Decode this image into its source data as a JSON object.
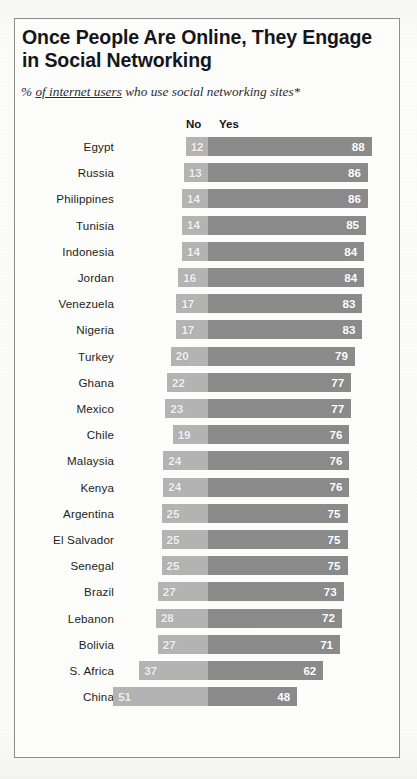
{
  "header": {
    "title": "Once People Are Online, They Engage in Social Networking",
    "subtitle_prefix": "% ",
    "subtitle_underlined": "of internet users",
    "subtitle_suffix": " who use social networking sites*"
  },
  "colors": {
    "no_bar": "#b4b4b4",
    "yes_bar": "#8b8b8b",
    "frame": "#8d8d8d",
    "text": "#15161a",
    "value_text": "#ffffff"
  },
  "chart_data": {
    "type": "bar",
    "title": "Once People Are Online, They Engage in Social Networking",
    "subtitle": "% of internet users who use social networking sites*",
    "orientation": "horizontal",
    "stacked": true,
    "diverging": true,
    "xlabel": "",
    "ylabel": "",
    "xlim": [
      0,
      100
    ],
    "grid": false,
    "legend_position": "top",
    "legend": [
      "No",
      "Yes"
    ],
    "categories": [
      "Egypt",
      "Russia",
      "Philippines",
      "Tunisia",
      "Indonesia",
      "Jordan",
      "Venezuela",
      "Nigeria",
      "Turkey",
      "Ghana",
      "Mexico",
      "Chile",
      "Malaysia",
      "Kenya",
      "Argentina",
      "El Salvador",
      "Senegal",
      "Brazil",
      "Lebanon",
      "Bolivia",
      "S. Africa",
      "China"
    ],
    "series": [
      {
        "name": "No",
        "values": [
          12,
          13,
          14,
          14,
          14,
          16,
          17,
          17,
          20,
          22,
          23,
          19,
          24,
          24,
          25,
          25,
          25,
          27,
          28,
          27,
          37,
          51
        ]
      },
      {
        "name": "Yes",
        "values": [
          88,
          86,
          86,
          85,
          84,
          84,
          83,
          83,
          79,
          77,
          77,
          76,
          76,
          76,
          75,
          75,
          75,
          73,
          72,
          71,
          62,
          48
        ]
      }
    ],
    "rows": [
      {
        "country": "Egypt",
        "no": 12,
        "yes": 88
      },
      {
        "country": "Russia",
        "no": 13,
        "yes": 86
      },
      {
        "country": "Philippines",
        "no": 14,
        "yes": 86
      },
      {
        "country": "Tunisia",
        "no": 14,
        "yes": 85
      },
      {
        "country": "Indonesia",
        "no": 14,
        "yes": 84
      },
      {
        "country": "Jordan",
        "no": 16,
        "yes": 84
      },
      {
        "country": "Venezuela",
        "no": 17,
        "yes": 83
      },
      {
        "country": "Nigeria",
        "no": 17,
        "yes": 83
      },
      {
        "country": "Turkey",
        "no": 20,
        "yes": 79
      },
      {
        "country": "Ghana",
        "no": 22,
        "yes": 77
      },
      {
        "country": "Mexico",
        "no": 23,
        "yes": 77
      },
      {
        "country": "Chile",
        "no": 19,
        "yes": 76
      },
      {
        "country": "Malaysia",
        "no": 24,
        "yes": 76
      },
      {
        "country": "Kenya",
        "no": 24,
        "yes": 76
      },
      {
        "country": "Argentina",
        "no": 25,
        "yes": 75
      },
      {
        "country": "El Salvador",
        "no": 25,
        "yes": 75
      },
      {
        "country": "Senegal",
        "no": 25,
        "yes": 75
      },
      {
        "country": "Brazil",
        "no": 27,
        "yes": 73
      },
      {
        "country": "Lebanon",
        "no": 28,
        "yes": 72
      },
      {
        "country": "Bolivia",
        "no": 27,
        "yes": 71
      },
      {
        "country": "S. Africa",
        "no": 37,
        "yes": 62
      },
      {
        "country": "China",
        "no": 51,
        "yes": 48
      }
    ]
  },
  "layout": {
    "divider_x": 208,
    "px_per_unit": 1.86,
    "row_height": 26.2,
    "bar_height": 19
  }
}
